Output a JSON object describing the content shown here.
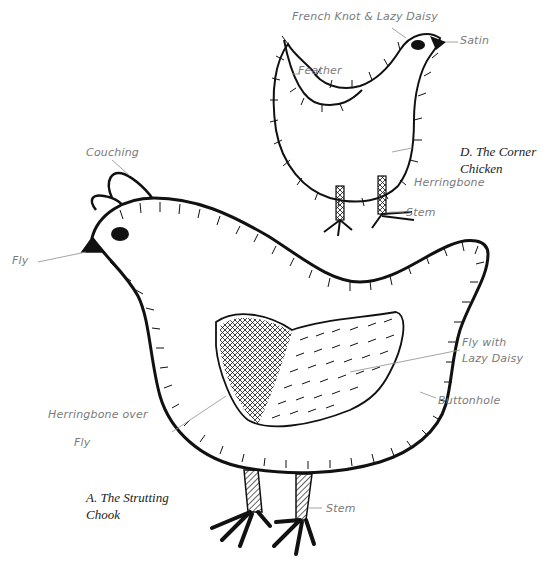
{
  "figure": {
    "type": "embroidery stitch diagram",
    "subjects": [
      {
        "id": "D",
        "caption_line1": "D. The Corner",
        "caption_line2": "Chicken",
        "labels": {
          "eye": "French Knot & Lazy Daisy",
          "beak": "Satin",
          "wing": "Feather",
          "legs": "Herringbone",
          "feet": "Stem"
        }
      },
      {
        "id": "A",
        "caption_line1": "A. The Strutting",
        "caption_line2": "Chook",
        "labels": {
          "comb": "Couching",
          "beak": "Fly",
          "wing_right": "Fly with",
          "wing_right_2": "Lazy Daisy",
          "outline": "Buttonhole",
          "wing_left": "Herringbone over",
          "wing_left_2": "Fly",
          "legs": "Stem"
        }
      }
    ],
    "colors": {
      "ink": "#111111",
      "label_text": "#7a7a7a",
      "leader_line": "#9a9a9a",
      "background": "#ffffff"
    }
  }
}
